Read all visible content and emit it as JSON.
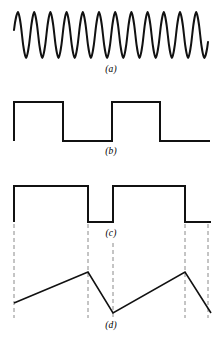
{
  "figure": {
    "width": 222,
    "height": 344,
    "background_color": "#ffffff",
    "stroke_color": "#111111",
    "dash_color": "#8a8a8a",
    "panel_count": 4
  },
  "labels": {
    "a": "(a)",
    "b": "(b)",
    "c": "(c)",
    "d": "(d)"
  },
  "chart_data": [
    {
      "id": "panel-a",
      "type": "line",
      "title": "(a)",
      "waveform": "sine",
      "cycles": 12,
      "x_start": 14,
      "x_end": 208,
      "y_top": 12,
      "y_bottom": 58,
      "y_center": 35,
      "amplitude": 23,
      "stroke_width": 2.0,
      "grid": false,
      "xlabel": "",
      "ylabel": ""
    },
    {
      "id": "panel-b",
      "type": "line",
      "title": "(b)",
      "waveform": "square",
      "duty_cycle": 0.5,
      "y_high": 102,
      "y_low": 141,
      "stroke_width": 2.0,
      "grid": false,
      "points": [
        [
          14,
          141
        ],
        [
          14,
          102
        ],
        [
          63,
          102
        ],
        [
          63,
          141
        ],
        [
          112,
          141
        ],
        [
          112,
          102
        ],
        [
          160,
          102
        ],
        [
          160,
          141
        ],
        [
          210,
          141
        ]
      ],
      "xlabel": "",
      "ylabel": ""
    },
    {
      "id": "panel-c",
      "type": "line",
      "title": "(c)",
      "waveform": "notched-pulse",
      "y_high": 186,
      "y_low": 222,
      "stroke_width": 2.0,
      "grid": false,
      "points": [
        [
          14,
          222
        ],
        [
          14,
          186
        ],
        [
          88,
          186
        ],
        [
          88,
          222
        ],
        [
          113,
          222
        ],
        [
          113,
          186
        ],
        [
          185,
          186
        ],
        [
          185,
          222
        ],
        [
          211,
          222
        ]
      ],
      "xlabel": "",
      "ylabel": ""
    },
    {
      "id": "panel-d",
      "type": "line",
      "title": "(d)",
      "waveform": "sawtooth-ramp",
      "y_peak": 272,
      "y_valley": 313,
      "stroke_width": 1.6,
      "grid": false,
      "points": [
        [
          14,
          303
        ],
        [
          88,
          272
        ],
        [
          113,
          313
        ],
        [
          185,
          272
        ],
        [
          211,
          313
        ]
      ],
      "xlabel": "",
      "ylabel": ""
    }
  ],
  "alignment_lines": {
    "style": "dashed",
    "color": "#8a8a8a",
    "stroke_width": 1.0,
    "dash_pattern": "4,3",
    "y_top": 224,
    "y_bottom": 318,
    "x_positions": [
      14,
      88,
      113,
      185,
      208
    ],
    "short_line": {
      "x": 113,
      "y_top": 243,
      "y_bottom": 318
    }
  }
}
